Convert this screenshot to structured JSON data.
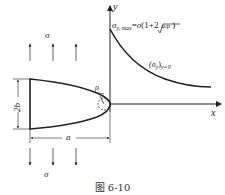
{
  "figure": {
    "caption": "图 6-10",
    "axes": {
      "x_label": "x",
      "y_label": "y"
    },
    "loads": {
      "top_label": "σ",
      "bottom_label": "σ",
      "top_direction": "up",
      "bottom_direction": "down",
      "arrow_count_each": 3
    },
    "crack": {
      "height_label": "2b",
      "length_label": "a",
      "tip_radius_label": "ρ"
    },
    "formula": {
      "lhs_symbol": "σ",
      "lhs_sub": "y, max",
      "equals": "=",
      "rhs_prefix": "σ",
      "rhs_open": "(1+2",
      "sqrt_content": "a/ρ",
      "rhs_close": ")"
    },
    "curve_label": {
      "symbol": "(σ",
      "sub1": "y",
      "close": ")",
      "sub2": "y=0"
    }
  }
}
